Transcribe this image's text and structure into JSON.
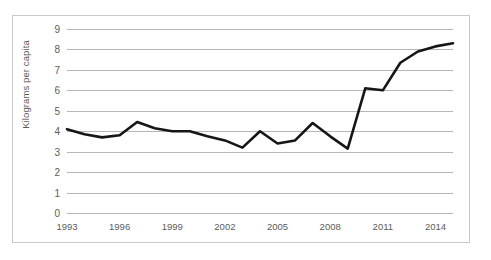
{
  "chart_data": {
    "type": "line",
    "title": "",
    "xlabel": "",
    "ylabel": "Kilograms per capita",
    "ylim": [
      0,
      9
    ],
    "xlim": [
      1993,
      2015
    ],
    "grid": true,
    "legend": "none",
    "y_ticks": [
      "0",
      "1",
      "2",
      "3",
      "4",
      "5",
      "6",
      "7",
      "8",
      "9"
    ],
    "y_tick_values": [
      0,
      1,
      2,
      3,
      4,
      5,
      6,
      7,
      8,
      9
    ],
    "x_ticks": [
      "1993",
      "1996",
      "1999",
      "2002",
      "2005",
      "2008",
      "2011",
      "2014"
    ],
    "x_tick_values": [
      1993,
      1996,
      1999,
      2002,
      2005,
      2008,
      2011,
      2014
    ],
    "x": [
      1993,
      1994,
      1995,
      1996,
      1997,
      1998,
      1999,
      2000,
      2001,
      2002,
      2003,
      2004,
      2005,
      2006,
      2007,
      2008,
      2009,
      2010,
      2011,
      2012,
      2013,
      2014,
      2015
    ],
    "values": [
      4.1,
      3.85,
      3.7,
      3.8,
      4.45,
      4.15,
      4.0,
      4.0,
      3.75,
      3.55,
      3.2,
      4.0,
      3.4,
      3.55,
      4.4,
      3.75,
      3.15,
      6.1,
      6.0,
      7.35,
      7.9,
      8.15,
      8.3
    ],
    "series": [
      {
        "name": "Kilograms per capita",
        "color": "#161616",
        "values": [
          4.1,
          3.85,
          3.7,
          3.8,
          4.45,
          4.15,
          4.0,
          4.0,
          3.75,
          3.55,
          3.2,
          4.0,
          3.4,
          3.55,
          4.4,
          3.75,
          3.15,
          6.1,
          6.0,
          7.35,
          7.9,
          8.15,
          8.3
        ]
      }
    ],
    "colors": {
      "line": "#161616",
      "gridline": "#b7b7b7",
      "tick_text": "#5c5c5c",
      "axis_title_text": "#595959",
      "border": "#c9c9c9",
      "background": "#ffffff"
    }
  }
}
